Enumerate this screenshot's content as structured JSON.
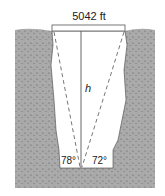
{
  "diagram": {
    "width_label": "5042 ft",
    "height_label": "h",
    "left_angle": "78°",
    "right_angle": "72°",
    "colors": {
      "ground": "#a9a9a9",
      "stipple": "#5a5a5a",
      "chasm": "#ffffff",
      "lines": "#555555"
    }
  }
}
